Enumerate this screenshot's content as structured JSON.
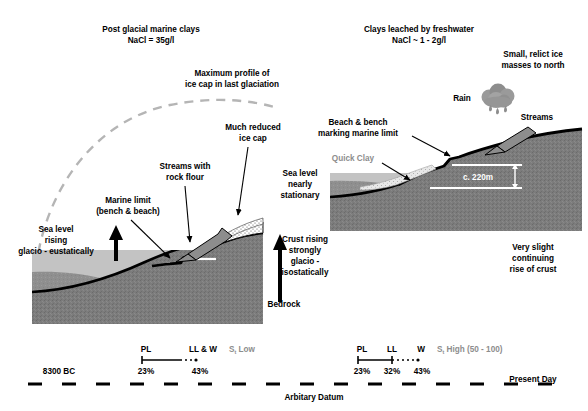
{
  "diagram": {
    "colors": {
      "bedrock": "#7c7c7c",
      "bedrock_dark": "#6e6e6e",
      "marine_clay": "#8f8f8f",
      "sea": "#c3c3c3",
      "ice_cap": "#ffffff",
      "quick_clay": "#d9d9d9",
      "outline": "#000000",
      "dashed_profile": "#b5b5b5",
      "gray_text": "#8d8d8d",
      "cloud": "#9a9a9a",
      "white_line": "#ffffff"
    }
  },
  "left_panel": {
    "heading_line1": "Post glacial marine clays",
    "heading_line2": "NaCl = 35g/l",
    "ice_profile_line1": "Maximum profile of",
    "ice_profile_line2": "ice cap in last glaciation",
    "reduced_ice_line1": "Much reduced",
    "reduced_ice_line2": "ice cap",
    "streams_line1": "Streams with",
    "streams_line2": "rock flour",
    "marine_limit_line1": "Marine limit",
    "marine_limit_line2": "(bench & beach)",
    "sea_level_line1": "Sea level",
    "sea_level_line2": "rising",
    "sea_level_line3": "glacio - eustatically",
    "crust_line1": "Crust rising",
    "crust_line2": "strongly",
    "crust_line3": "glacio -",
    "crust_line4": "isostatically",
    "bedrock_label": "Bedrock"
  },
  "right_panel": {
    "heading_line1": "Clays leached by freshwater",
    "heading_line2": "NaCl ~ 1 - 2g/l",
    "relict_ice_line1": "Small, relict ice",
    "relict_ice_line2": "masses to north",
    "beach_bench_line1": "Beach & bench",
    "beach_bench_line2": "marking marine limit",
    "rain_label": "Rain",
    "streams_label": "Streams",
    "quick_clay_label": "Quick Clay",
    "sea_level_line1": "Sea level",
    "sea_level_line2": "nearly",
    "sea_level_line3": "stationary",
    "elevation_label": "c. 220m",
    "crust_rise_line1": "Very slight",
    "crust_rise_line2": "continuing",
    "crust_rise_line3": "rise of crust"
  },
  "timeline": {
    "start_label": "8300 BC",
    "end_label": "Present Day",
    "datum_label": "Arbitary Datum",
    "left_scale": {
      "marks": [
        "PL",
        "LL & W"
      ],
      "values": [
        "23%",
        "43%"
      ],
      "sensitivity": "S",
      "sensitivity_sub": "t",
      "sensitivity_text": "Low"
    },
    "right_scale": {
      "marks": [
        "PL",
        "LL",
        "W"
      ],
      "values": [
        "23%",
        "32%",
        "43%"
      ],
      "sensitivity": "S",
      "sensitivity_sub": "t",
      "sensitivity_text": "High (50 - 100)"
    }
  }
}
